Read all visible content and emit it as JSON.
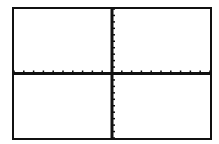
{
  "chart_data": {
    "type": "line",
    "title": "",
    "xlabel": "",
    "ylabel": "",
    "xlim": [
      -10,
      10
    ],
    "ylim": [
      -10,
      10
    ],
    "xscale": 1,
    "yscale": 1,
    "grid": false,
    "axes": {
      "x_axis_visible": true,
      "y_axis_visible": true,
      "tick_marks": true
    },
    "series": []
  },
  "screen": {
    "background": "#ffffff",
    "axis_color": "#111111",
    "frame_color": "#111111"
  }
}
